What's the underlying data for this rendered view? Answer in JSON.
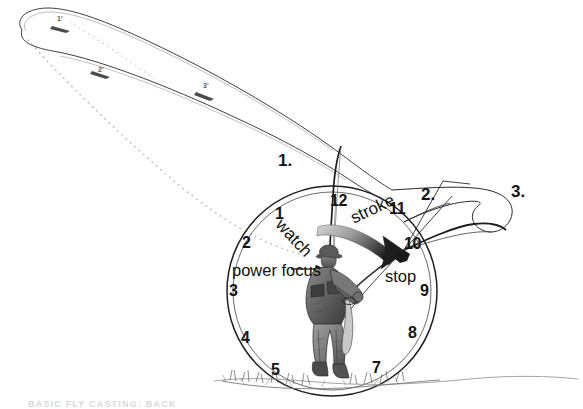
{
  "figure": {
    "caption": "BASIC FLY CASTING: BACK",
    "background_color": "#ffffff",
    "ink_color": "#141414"
  },
  "step_markers": [
    {
      "id": "step-1",
      "label": "1.",
      "x": 278,
      "y": 152
    },
    {
      "id": "step-2",
      "label": "2.",
      "x": 421,
      "y": 186
    },
    {
      "id": "step-3",
      "label": "3.",
      "x": 511,
      "y": 183
    }
  ],
  "loop_markers": [
    {
      "id": "loop-1",
      "label": "1'",
      "x": 57,
      "y": 15
    },
    {
      "id": "loop-2",
      "label": "2'",
      "x": 98,
      "y": 66
    },
    {
      "id": "loop-3",
      "label": "3'",
      "x": 203,
      "y": 82
    }
  ],
  "clock": {
    "center_x": 332,
    "center_y": 291,
    "radius_outer": 105,
    "radius_inner": 99,
    "hours": [
      {
        "hour": "12",
        "x": 330,
        "y": 201
      },
      {
        "hour": "11",
        "x": 389,
        "y": 209
      },
      {
        "hour": "10",
        "x": 416,
        "y": 243
      },
      {
        "hour": "9",
        "x": 424,
        "y": 290
      },
      {
        "hour": "8",
        "x": 410,
        "y": 332
      },
      {
        "hour": "7",
        "x": 374,
        "y": 367
      },
      {
        "hour": "5",
        "x": 273,
        "y": 370
      },
      {
        "hour": "4",
        "x": 243,
        "y": 337
      },
      {
        "hour": "3",
        "x": 231,
        "y": 291
      },
      {
        "hour": "2",
        "x": 244,
        "y": 242
      },
      {
        "hour": "1",
        "x": 277,
        "y": 213
      }
    ]
  },
  "annotations": [
    {
      "id": "watch",
      "label": "watch",
      "x": 285,
      "y": 222
    },
    {
      "id": "stroke",
      "label": "stroke",
      "x": 352,
      "y": 206
    },
    {
      "id": "power-focus",
      "label": "power focus",
      "x": 232,
      "y": 270
    },
    {
      "id": "stop",
      "label": "stop",
      "x": 385,
      "y": 275
    }
  ]
}
